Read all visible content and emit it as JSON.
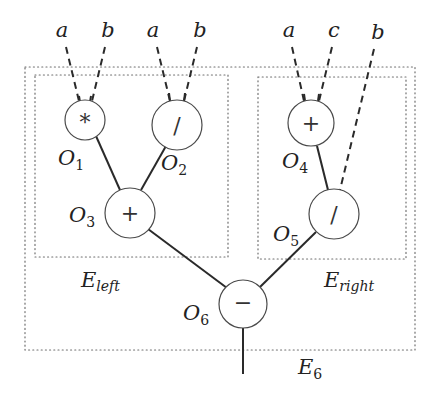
{
  "diagram": {
    "inputs": {
      "o1_left": "a",
      "o1_right": "b",
      "o2_left": "a",
      "o2_right": "b",
      "o4_left": "a",
      "o4_right": "c",
      "o5_right": "b"
    },
    "nodes": {
      "o1": {
        "symbol": "*",
        "label": "O",
        "index": "1"
      },
      "o2": {
        "symbol": "/",
        "label": "O",
        "index": "2"
      },
      "o3": {
        "symbol": "+",
        "label": "O",
        "index": "3"
      },
      "o4": {
        "symbol": "+",
        "label": "O",
        "index": "4"
      },
      "o5": {
        "symbol": "/",
        "label": "O",
        "index": "5"
      },
      "o6": {
        "symbol": "−",
        "label": "O",
        "index": "6"
      }
    },
    "regions": {
      "left": {
        "label": "E",
        "subscript": "left"
      },
      "right": {
        "label": "E",
        "subscript": "right"
      },
      "outer": {
        "label": "E",
        "subscript": "6"
      }
    },
    "edges": [
      {
        "from": "a",
        "to": "O1",
        "style": "dashed"
      },
      {
        "from": "b",
        "to": "O1",
        "style": "dashed"
      },
      {
        "from": "a",
        "to": "O2",
        "style": "dashed"
      },
      {
        "from": "b",
        "to": "O2",
        "style": "dashed"
      },
      {
        "from": "a",
        "to": "O4",
        "style": "dashed"
      },
      {
        "from": "c",
        "to": "O4",
        "style": "dashed"
      },
      {
        "from": "b",
        "to": "O5",
        "style": "dashed"
      },
      {
        "from": "O1",
        "to": "O3",
        "style": "solid"
      },
      {
        "from": "O2",
        "to": "O3",
        "style": "solid"
      },
      {
        "from": "O4",
        "to": "O5",
        "style": "solid"
      },
      {
        "from": "O3",
        "to": "O6",
        "style": "solid"
      },
      {
        "from": "O5",
        "to": "O6",
        "style": "solid"
      },
      {
        "from": "O6",
        "to": "output",
        "style": "solid"
      }
    ]
  }
}
